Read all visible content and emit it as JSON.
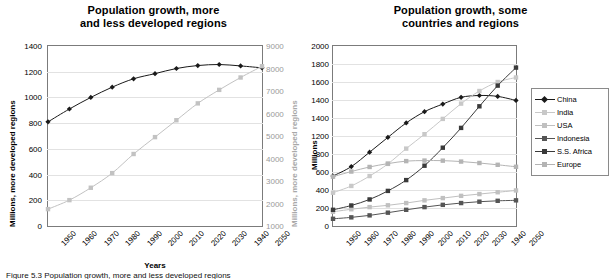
{
  "figure": {
    "caption": "Figure 5.3 Population growth, more and less developed regions"
  },
  "chart_data": [
    {
      "id": "left",
      "type": "line",
      "title_line1": "Population growth, more",
      "title_line2": "and less developed regions",
      "xlabel": "Years",
      "ylabel": "Millions, more developed regions",
      "ylabel_secondary": "Millions, more developed regions",
      "x": [
        "1950",
        "1960",
        "1970",
        "1980",
        "1990",
        "2000",
        "2010",
        "2020",
        "2030",
        "1940",
        "2050"
      ],
      "ylim": [
        0,
        1400
      ],
      "yticks": [
        "1400",
        "1200",
        "1000",
        "800",
        "600",
        "400",
        "200",
        "0"
      ],
      "ylim_secondary": [
        1000,
        9000
      ],
      "yticks_secondary": [
        "9000",
        "8000",
        "7000",
        "6000",
        "5000",
        "4000",
        "3000",
        "2000",
        "1000"
      ],
      "grid": true,
      "legend_position": "none",
      "series": [
        {
          "name": "More developed regions",
          "axis": "left",
          "color": "#1a1a1a",
          "marker": "diamond",
          "values": [
            810,
            910,
            1000,
            1080,
            1145,
            1185,
            1225,
            1248,
            1256,
            1245,
            1230
          ]
        },
        {
          "name": "Less developed regions",
          "axis": "right",
          "color": "#c2c2c2",
          "marker": "square",
          "values": [
            1750,
            2150,
            2700,
            3350,
            4200,
            4950,
            5700,
            6450,
            7050,
            7600,
            8100
          ]
        }
      ]
    },
    {
      "id": "right",
      "type": "line",
      "title_line1": "Population growth, some",
      "title_line2": "countries and regions",
      "xlabel": "",
      "ylabel": "Millions",
      "x": [
        "1950",
        "1960",
        "1970",
        "1980",
        "1990",
        "2000",
        "2010",
        "2020",
        "2030",
        "1940",
        "2050"
      ],
      "ylim": [
        0,
        2000
      ],
      "yticks": [
        "2000",
        "1800",
        "1600",
        "1400",
        "1400",
        "1200",
        "800",
        "600",
        "400",
        "200",
        "0"
      ],
      "grid": true,
      "legend_position": "right",
      "series": [
        {
          "name": "China",
          "color": "#1a1a1a",
          "marker": "diamond",
          "values": [
            555,
            660,
            820,
            985,
            1145,
            1270,
            1355,
            1430,
            1450,
            1440,
            1395
          ]
        },
        {
          "name": "India",
          "color": "#c8c8c8",
          "marker": "square",
          "values": [
            370,
            445,
            555,
            690,
            860,
            1020,
            1190,
            1360,
            1500,
            1600,
            1650
          ]
        },
        {
          "name": "USA",
          "color": "#c0c0c0",
          "marker": "square",
          "values": [
            158,
            186,
            210,
            230,
            255,
            285,
            310,
            335,
            355,
            375,
            395
          ]
        },
        {
          "name": "Indonesia",
          "color": "#555555",
          "marker": "square",
          "values": [
            80,
            96,
            118,
            148,
            180,
            210,
            235,
            255,
            270,
            280,
            285
          ]
        },
        {
          "name": "S.S. Africa",
          "color": "#3a3a3a",
          "marker": "square",
          "values": [
            180,
            228,
            295,
            390,
            510,
            670,
            870,
            1090,
            1330,
            1560,
            1760
          ]
        },
        {
          "name": "Europe",
          "color": "#b4b4b4",
          "marker": "square",
          "values": [
            548,
            605,
            656,
            693,
            721,
            727,
            726,
            716,
            700,
            680,
            658
          ]
        }
      ]
    }
  ]
}
